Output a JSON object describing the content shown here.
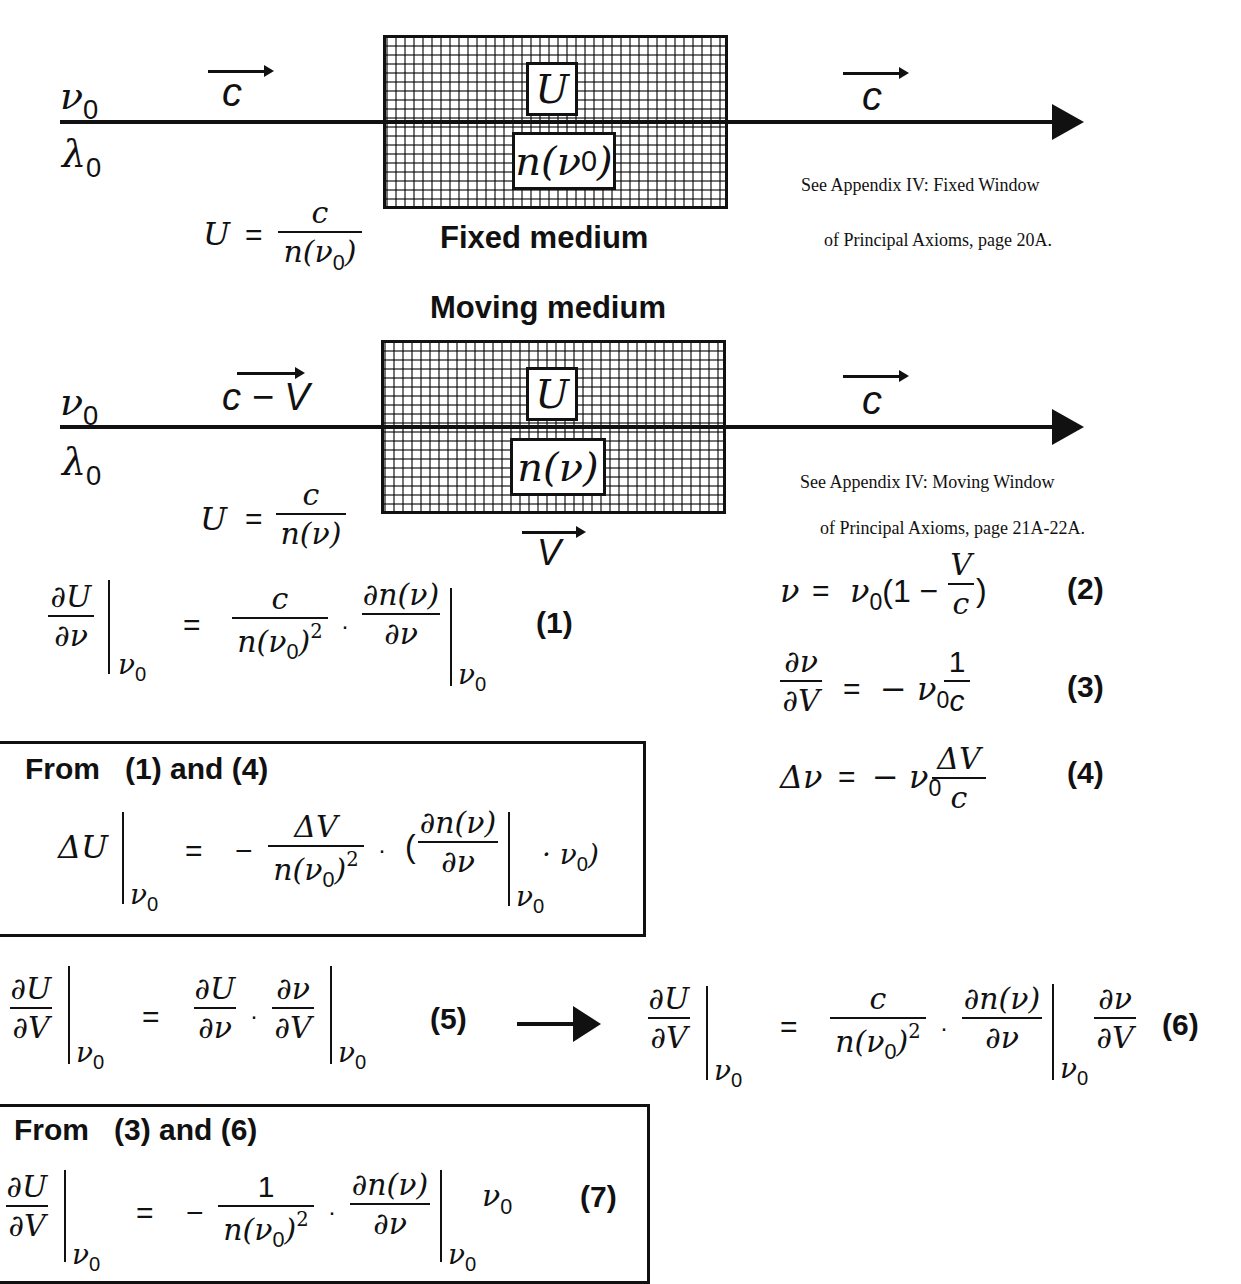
{
  "fixed_section": {
    "nu0": "ν",
    "lambda0": "λ",
    "zero": "0",
    "c_label": "c",
    "U_label": "U",
    "n_label": "n(ν",
    "n_close": ")",
    "title": "Fixed medium",
    "eq_U": "U",
    "eq_eq": "=",
    "eq_num": "c",
    "eq_den": "n(ν",
    "eq_den_close": ")",
    "c_out": "c",
    "note_line1": "See Appendix IV:  Fixed Window",
    "note_line2": "of Principal Axioms, page 20A."
  },
  "moving_section": {
    "title": "Moving medium",
    "nu0": "ν",
    "lambda0": "λ",
    "zero": "0",
    "c_minus_v": "c − V",
    "U_label": "U",
    "n_label": "n(ν)",
    "eq_U": "U",
    "eq_eq": "=",
    "eq_num": "c",
    "eq_den": "n(ν)",
    "V_label": "V",
    "c_out": "c",
    "note_line1": "See Appendix IV:  Moving Window",
    "note_line2": "of Principal Axioms, page 21A-22A."
  },
  "equations": {
    "eq1": {
      "lhs_num": "∂U",
      "lhs_den": "∂ν",
      "at": "ν",
      "zero": "0",
      "eq": "=",
      "t1_num": "c",
      "t1_den": "n(ν",
      "t1_den_close": ")",
      "sq": "2",
      "dot": "·",
      "t2_num": "∂n(ν)",
      "t2_den": "∂ν",
      "label": "(1)"
    },
    "eq2": {
      "lhs": "ν",
      "eq": "=",
      "rhs_a": "ν",
      "zero": "0",
      "rhs_b": "(1 −",
      "f_num": "V",
      "f_den": "c",
      "rhs_c": ")",
      "label": "(2)"
    },
    "eq3": {
      "lhs_num": "∂ν",
      "lhs_den": "∂V",
      "eq": "=",
      "rhs_a": "− ν",
      "zero": "0",
      "f_num": "1",
      "f_den": "c",
      "label": "(3)"
    },
    "eq4": {
      "lhs": "Δν",
      "eq": "=",
      "rhs_a": "− ν",
      "zero": "0",
      "f_num": "ΔV",
      "f_den": "c",
      "label": "(4)"
    },
    "box1": {
      "heading": "From   (1) and (4)",
      "lhs": "ΔU",
      "at": "ν",
      "zero": "0",
      "eq": "=",
      "minus": "−",
      "f_num": "ΔV",
      "f_den": "n(ν",
      "f_den_close": ")",
      "sq": "2",
      "dot": "·",
      "open": "(",
      "g_num": "∂n(ν)",
      "g_den": "∂ν",
      "tail": "· ν",
      "close": ")"
    },
    "eq5": {
      "lhs_num": "∂U",
      "lhs_den": "∂V",
      "at": "ν",
      "zero": "0",
      "eq": "=",
      "a_num": "∂U",
      "a_den": "∂ν",
      "dot": "·",
      "b_num": "∂ν",
      "b_den": "∂V",
      "label": "(5)"
    },
    "eq6": {
      "lhs_num": "∂U",
      "lhs_den": "∂V",
      "at": "ν",
      "zero": "0",
      "eq": "=",
      "t1_num": "c",
      "t1_den": "n(ν",
      "t1_den_close": ")",
      "sq": "2",
      "dot": "·",
      "t2_num": "∂n(ν)",
      "t2_den": "∂ν",
      "t3_num": "∂ν",
      "t3_den": "∂V",
      "label": "(6)"
    },
    "box2": {
      "heading": "From   (3) and (6)",
      "lhs_num": "∂U",
      "lhs_den": "∂V",
      "at": "ν",
      "zero": "0",
      "eq": "=",
      "minus": "−",
      "t1_num": "1",
      "t1_den": "n(ν",
      "t1_den_close": ")",
      "sq": "2",
      "dot": "·",
      "t2_num": "∂n(ν)",
      "t2_den": "∂ν",
      "tail": "ν",
      "label": "(7)"
    }
  }
}
